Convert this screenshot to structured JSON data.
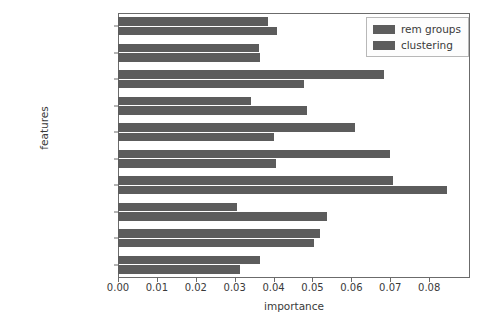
{
  "chart_data": {
    "type": "bar",
    "orientation": "horizontal",
    "title": "",
    "xlabel": "importance",
    "ylabel": "features",
    "categories": [
      "S_M",
      "S_F",
      "D_SAOS",
      "D_RONCOPATIA",
      "D_D. Afectiva",
      "M_trazodona",
      "M_ssri",
      "M_bzd",
      "P_depression",
      "P_epilepsy"
    ],
    "series": [
      {
        "name": "rem groups",
        "color": "#5c5c5c",
        "values": [
          0.0385,
          0.0362,
          0.0685,
          0.0341,
          0.061,
          0.07,
          0.0706,
          0.0305,
          0.0519,
          0.0366
        ]
      },
      {
        "name": "clustering",
        "color": "#5c5c5c",
        "values": [
          0.041,
          0.0366,
          0.0478,
          0.0487,
          0.0402,
          0.0407,
          0.0847,
          0.0537,
          0.0504,
          0.0314
        ]
      }
    ],
    "xlim": [
      0.0,
      0.0905
    ],
    "xticks": [
      0.0,
      0.01,
      0.02,
      0.03,
      0.04,
      0.05,
      0.06,
      0.07,
      0.08
    ],
    "xtick_labels": [
      "0.00",
      "0.01",
      "0.02",
      "0.03",
      "0.04",
      "0.05",
      "0.06",
      "0.07",
      "0.08"
    ],
    "grid": false,
    "legend": {
      "position": "upper right",
      "entries": [
        "rem groups",
        "clustering"
      ]
    }
  }
}
